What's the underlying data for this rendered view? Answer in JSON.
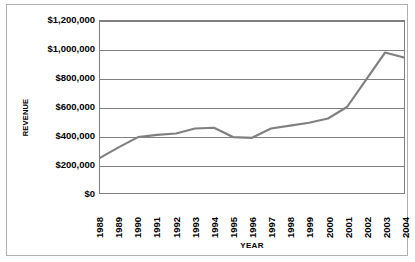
{
  "chart_data": {
    "type": "line",
    "title": "",
    "xlabel": "YEAR",
    "ylabel": "REVENUE",
    "categories": [
      "1988",
      "1989",
      "1990",
      "1991",
      "1992",
      "1993",
      "1994",
      "1995",
      "1996",
      "1997",
      "1998",
      "1999",
      "2000",
      "2001",
      "2002",
      "2003",
      "2004"
    ],
    "values": [
      245000,
      320000,
      390000,
      405000,
      415000,
      450000,
      455000,
      390000,
      385000,
      450000,
      470000,
      490000,
      520000,
      600000,
      790000,
      980000,
      945000
    ],
    "series": [
      {
        "name": "Revenue",
        "color": "#808080",
        "values": [
          245000,
          320000,
          390000,
          405000,
          415000,
          450000,
          455000,
          390000,
          385000,
          450000,
          470000,
          490000,
          520000,
          600000,
          790000,
          980000,
          945000
        ]
      }
    ],
    "ylim": [
      0,
      1200000
    ],
    "ytick_values": [
      0,
      200000,
      400000,
      600000,
      800000,
      1000000,
      1200000
    ],
    "ytick_labels": [
      "$0",
      "$200,000",
      "$400,000",
      "$600,000",
      "$800,000",
      "$1,000,000",
      "$1,200,000"
    ],
    "grid": true,
    "legend": "none",
    "line_color": "#808080",
    "plot_border_color": "#808080",
    "frame_border_color": "#b0b0b0"
  }
}
